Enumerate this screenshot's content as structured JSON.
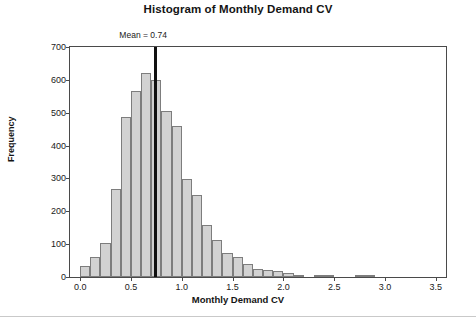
{
  "chart_data": {
    "type": "bar",
    "title": "Histogram of Monthly Demand CV",
    "xlabel": "Monthly Demand CV",
    "ylabel": "Frequency",
    "xlim": [
      -0.1,
      3.6
    ],
    "ylim": [
      0,
      700
    ],
    "grid": false,
    "legend": null,
    "bin_width": 0.1,
    "bar_color": "#d2d2d2",
    "bar_edge_color": "#7d7d7d",
    "xticks": [
      "0.0",
      "0.5",
      "1.0",
      "1.5",
      "2.0",
      "2.5",
      "3.0",
      "3.5"
    ],
    "xtick_values": [
      0.0,
      0.5,
      1.0,
      1.5,
      2.0,
      2.5,
      3.0,
      3.5
    ],
    "yticks": [
      "0",
      "100",
      "200",
      "300",
      "400",
      "500",
      "600",
      "700"
    ],
    "ytick_values": [
      0,
      100,
      200,
      300,
      400,
      500,
      600,
      700
    ],
    "bin_starts": [
      0.0,
      0.1,
      0.2,
      0.3,
      0.4,
      0.5,
      0.6,
      0.7,
      0.8,
      0.9,
      1.0,
      1.1,
      1.2,
      1.3,
      1.4,
      1.5,
      1.6,
      1.7,
      1.8,
      1.9,
      2.0,
      2.1,
      2.3,
      2.4,
      2.7,
      2.8
    ],
    "values": [
      35,
      60,
      105,
      268,
      487,
      565,
      622,
      600,
      504,
      460,
      298,
      250,
      159,
      112,
      74,
      62,
      40,
      25,
      22,
      18,
      12,
      6,
      5,
      4,
      4,
      4
    ],
    "annotations": [
      {
        "name": "mean-line",
        "label": "Mean = 0.74",
        "x": 0.74,
        "y_top": 700,
        "color": "#111111"
      }
    ]
  }
}
